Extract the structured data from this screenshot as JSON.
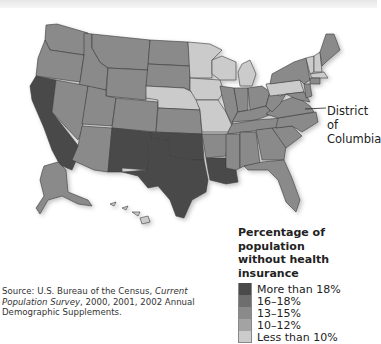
{
  "map": {
    "title": "Percentage of population without health insurance",
    "annotation": {
      "label_line1": "District of",
      "label_line2": "Columbia"
    }
  },
  "legend": {
    "title_line1": "Percentage of population",
    "title_line2": "without health insurance",
    "items": [
      {
        "label": "More than 18%",
        "color": "#4a4a4a"
      },
      {
        "label": "16–18%",
        "color": "#6e6e6e"
      },
      {
        "label": "13–15%",
        "color": "#8a8a8a"
      },
      {
        "label": "10–12%",
        "color": "#a3a3a3"
      },
      {
        "label": "Less than 10%",
        "color": "#cbcbcb"
      }
    ]
  },
  "source": {
    "prefix": "Source: U.S. Bureau of the Census, ",
    "italic": "Current Population Survey",
    "suffix": ", 2000, 2001, 2002 Annual Demographic Supplements."
  },
  "states": {
    "more_than_18": [
      "California",
      "Arizona? no — New Mexico",
      "Texas",
      "Oklahoma",
      "Louisiana"
    ],
    "less_than_10": [
      "Minnesota",
      "Wisconsin",
      "Michigan",
      "Iowa",
      "Missouri",
      "Nebraska",
      "Pennsylvania",
      "Vermont",
      "New Hampshire",
      "Massachusetts",
      "Rhode Island",
      "Hawaii"
    ]
  }
}
